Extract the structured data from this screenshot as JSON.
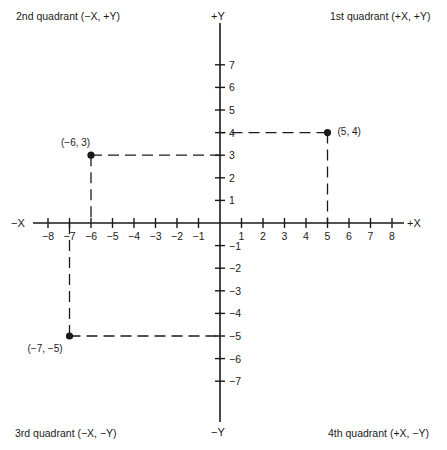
{
  "quadrants": {
    "q1": "1st quadrant (+X, +Y)",
    "q2": "2nd quadrant (−X, +Y)",
    "q3": "3rd quadrant (−X, −Y)",
    "q4": "4th quadrant (+X, −Y)"
  },
  "axes": {
    "pos_x": "+X",
    "neg_x": "−X",
    "pos_y": "+Y",
    "neg_y": "−Y",
    "x_ticks": [
      -8,
      -7,
      -6,
      -5,
      -4,
      -3,
      -2,
      -1,
      1,
      2,
      3,
      4,
      5,
      6,
      7,
      8
    ],
    "y_ticks": [
      7,
      6,
      5,
      4,
      3,
      2,
      1,
      -1,
      -2,
      -3,
      -4,
      -5,
      -6,
      -7
    ]
  },
  "points": [
    {
      "x": 5,
      "y": 4,
      "label": "(5, 4)"
    },
    {
      "x": -6,
      "y": 3,
      "label": "(−6, 3)"
    },
    {
      "x": -7,
      "y": -5,
      "label": "(−7, −5)"
    }
  ],
  "colors": {
    "ink": "#1a1a1a",
    "background": "#ffffff"
  },
  "chart_data": {
    "type": "scatter",
    "xlabel": "X",
    "ylabel": "Y",
    "xlim": [
      -8,
      8
    ],
    "ylim": [
      -7,
      7
    ],
    "x": [
      5,
      -6,
      -7
    ],
    "y": [
      4,
      3,
      -5
    ],
    "labels": [
      "(5, 4)",
      "(−6, 3)",
      "(−7, −5)"
    ],
    "annotations": [
      "1st quadrant (+X, +Y)",
      "2nd quadrant (−X, +Y)",
      "3rd quadrant (−X, −Y)",
      "4th quadrant (+X, −Y)"
    ],
    "grid": false
  }
}
